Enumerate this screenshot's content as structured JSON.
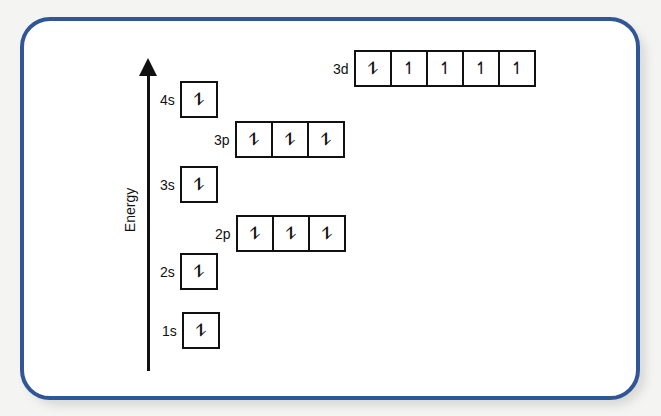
{
  "diagram": {
    "type": "orbital-energy-diagram",
    "axis_label": "Energy",
    "frame_color": "#2f5797",
    "orbitals": [
      {
        "name": "1s",
        "electrons": [
          "⥮"
        ]
      },
      {
        "name": "2s",
        "electrons": [
          "⥮"
        ]
      },
      {
        "name": "2p",
        "electrons": [
          "⥮",
          "⥮",
          "⥮"
        ]
      },
      {
        "name": "3s",
        "electrons": [
          "⥮"
        ]
      },
      {
        "name": "3p",
        "electrons": [
          "⥮",
          "⥮",
          "⥮"
        ]
      },
      {
        "name": "4s",
        "electrons": [
          "⥮"
        ]
      },
      {
        "name": "3d",
        "electrons": [
          "⥮",
          "↿",
          "↿",
          "↿",
          "↿"
        ]
      }
    ]
  }
}
